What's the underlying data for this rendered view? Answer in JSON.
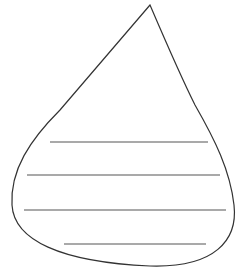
{
  "figure": {
    "stroke_color": "#333333",
    "line_color": "#555555",
    "background": "#ffffff",
    "outline_path": "M150,5 C120,40 90,75 60,110 C30,140 10,170 12,205 C14,240 60,262 150,266 C215,268 238,240 234,205 C230,170 215,140 195,105 C180,75 165,40 150,5 Z",
    "ruled_lines": [
      {
        "x1": 50,
        "x2": 208,
        "y": 142
      },
      {
        "x1": 27,
        "x2": 220,
        "y": 175
      },
      {
        "x1": 24,
        "x2": 226,
        "y": 210
      },
      {
        "x1": 64,
        "x2": 206,
        "y": 244
      }
    ]
  }
}
